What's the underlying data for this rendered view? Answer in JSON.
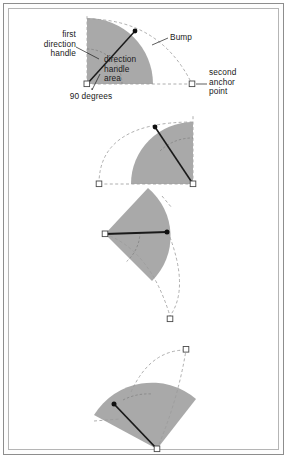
{
  "figure": {
    "panel_count": 4,
    "colors": {
      "fan_fill": "#a9a9a9",
      "fan_fill_light": "#bdbdbd",
      "handle_line": "#1a1a1a",
      "dashed_guide": "#9a9a9a",
      "anchor_stroke": "#4a4a4a",
      "anchor_fill": "#ffffff",
      "handle_dot": "#101010",
      "frame_outer": "#8d8d8d",
      "frame_inner": "#b5b5b5",
      "text": "#1a1a1a",
      "page_bg": "#ffffff"
    }
  },
  "labels": {
    "first_direction_handle": "first\ndirection\nhandle",
    "direction_handle_area": "direction\nhandle\narea",
    "ninety_degrees": "90 degrees",
    "bump": "Bump",
    "second_anchor_point": "second\nanchor\npoint"
  },
  "panels": [
    {
      "name": "panel-1-upright",
      "anchor_first": {
        "x": 87,
        "y": 84
      },
      "anchor_second": {
        "x": 192,
        "y": 84
      },
      "handle_end": {
        "x": 135,
        "y": 31
      },
      "fan_radius": 66,
      "fan_start_angle_deg": 0,
      "fan_sweep_deg": 90,
      "arc_angle_deg": 90
    },
    {
      "name": "panel-2-rotated-right",
      "anchor_first": {
        "x": 193,
        "y": 184
      },
      "anchor_second": {
        "x": 99,
        "y": 184
      },
      "handle_end": {
        "x": 155,
        "y": 127
      },
      "fan_radius": 62,
      "fan_start_angle_deg": 90,
      "fan_sweep_deg": 90
    },
    {
      "name": "panel-3-rotated-horizontal",
      "anchor_first": {
        "x": 105,
        "y": 234
      },
      "anchor_second": {
        "x": 170,
        "y": 319
      },
      "handle_end": {
        "x": 167,
        "y": 232
      },
      "fan_radius": 63,
      "fan_start_angle_deg": 150,
      "fan_sweep_deg": 90
    },
    {
      "name": "panel-4-rotated-diagonal",
      "anchor_first": {
        "x": 157,
        "y": 449
      },
      "anchor_second": {
        "x": 186,
        "y": 349
      },
      "handle_end": {
        "x": 114,
        "y": 404
      },
      "fan_radius": 68,
      "fan_start_angle_deg": 200,
      "fan_sweep_deg": 90
    }
  ]
}
